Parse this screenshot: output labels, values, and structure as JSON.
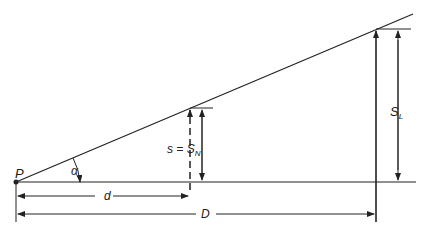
{
  "diagram": {
    "labels": {
      "point": "P",
      "angle": "α",
      "near_height_s": "s = S",
      "near_height_sub": "N",
      "far_height": "S",
      "far_height_sub": "L",
      "near_distance": "d",
      "far_distance": "D"
    },
    "colors": {
      "line": "#222222",
      "background": "#ffffff"
    }
  }
}
